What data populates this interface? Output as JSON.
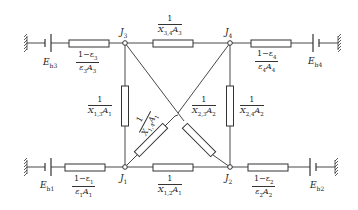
{
  "diagram": {
    "type": "radiation-network-circuit",
    "nodes": [
      {
        "id": "J1",
        "label": "J",
        "sub": "1"
      },
      {
        "id": "J2",
        "label": "J",
        "sub": "2"
      },
      {
        "id": "J3",
        "label": "J",
        "sub": "3"
      },
      {
        "id": "J4",
        "label": "J",
        "sub": "4"
      }
    ],
    "sources": {
      "Eb1": {
        "label": "E",
        "sub": "b1"
      },
      "Eb2": {
        "label": "E",
        "sub": "b2"
      },
      "Eb3": {
        "label": "E",
        "sub": "b3"
      },
      "Eb4": {
        "label": "E",
        "sub": "b4"
      }
    },
    "surface_resistances": {
      "R1": {
        "num": "1−ε",
        "num_sub": "1",
        "den": "ε",
        "den_sub": "1",
        "den2": "A",
        "den2_sub": "1"
      },
      "R2": {
        "num": "1−ε",
        "num_sub": "2",
        "den": "ε",
        "den_sub": "2",
        "den2": "A",
        "den2_sub": "2"
      },
      "R3": {
        "num": "1−ε",
        "num_sub": "3",
        "den": "ε",
        "den_sub": "3",
        "den2": "A",
        "den2_sub": "3"
      },
      "R4": {
        "num": "1−ε",
        "num_sub": "4",
        "den": "ε",
        "den_sub": "4",
        "den2": "A",
        "den2_sub": "4"
      }
    },
    "space_resistances": {
      "R12": {
        "num": "1",
        "den": "X",
        "den_sub": "1,2",
        "den2": "A",
        "den2_sub": "1"
      },
      "R13": {
        "num": "1",
        "den": "X",
        "den_sub": "1,3",
        "den2": "A",
        "den2_sub": "1"
      },
      "R14": {
        "num": "1",
        "den": "X",
        "den_sub": "1,4",
        "den2": "A",
        "den2_sub": "1"
      },
      "R23": {
        "num": "1",
        "den": "X",
        "den_sub": "2,3",
        "den2": "A",
        "den2_sub": "2"
      },
      "R24": {
        "num": "1",
        "den": "X",
        "den_sub": "2,4",
        "den2": "A",
        "den2_sub": "2"
      },
      "R34": {
        "num": "1",
        "den": "X",
        "den_sub": "3,4",
        "den2": "A",
        "den2_sub": "3"
      }
    }
  }
}
